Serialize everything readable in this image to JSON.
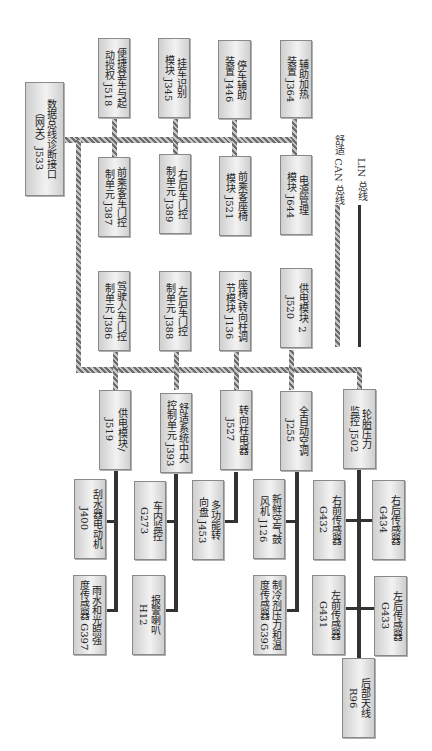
{
  "diagram": {
    "gateway": {
      "label": "数据总线诊断接口\n（网关）J533"
    },
    "can_top_row": [
      {
        "label": "便捷登车与起\n动授权 J518"
      },
      {
        "label": "挂车识别\n模块 J345"
      },
      {
        "label": "停车辅助\n装置 J446"
      },
      {
        "label": "辅助加热\n装置 J364"
      }
    ],
    "can_second_row": [
      {
        "label": "前乘客车门控\n制单元 J387"
      },
      {
        "label": "右后车门控\n制单元 J389"
      },
      {
        "label": "前乘客座椅\n模块 J521"
      },
      {
        "label": "电源管理\n模块 J644"
      }
    ],
    "can_third_row": [
      {
        "label": "驾驶人车门控\n制单元 J386"
      },
      {
        "label": "左后车门控\n制单元 J388"
      },
      {
        "label": "座椅/转向柱调\n节模块 J136"
      },
      {
        "label": "供电模块 2\nJ520"
      }
    ],
    "can_fourth_row": [
      {
        "label": "供电模块/\nJ519"
      },
      {
        "label": "舒适系统中央\n控制单元 J393"
      },
      {
        "label": "转向柱电器\nJ527"
      },
      {
        "label": "全自动空调\nJ255"
      },
      {
        "label": "轮胎压力\n监控 J502"
      }
    ],
    "lin_devices": {
      "j519": [
        {
          "label": "刮水器电动机\nJ400"
        },
        {
          "label": "雨水和光照强\n度传感器 G397"
        }
      ],
      "j393": [
        {
          "label": "车内监控\nG273"
        },
        {
          "label": "报警喇叭\nH12"
        }
      ],
      "j527": [
        {
          "label": "多功能转\n向盘 J453"
        }
      ],
      "j255": [
        {
          "label": "新鲜空气鼓\n风机 J126"
        },
        {
          "label": "制冷剂压力和温\n度传感器 G395"
        }
      ],
      "j502": [
        {
          "label": "右前传感器\nG432"
        },
        {
          "label": "右后传感器\nG434"
        },
        {
          "label": "左前传感器\nG431"
        },
        {
          "label": "左后传感器\nG433"
        },
        {
          "label": "后部天线\nR96"
        }
      ]
    },
    "legend": [
      {
        "line_type": "comfort-can",
        "label": "舒适 CAN 总线"
      },
      {
        "line_type": "lin",
        "label": "LIN 总线"
      }
    ]
  }
}
